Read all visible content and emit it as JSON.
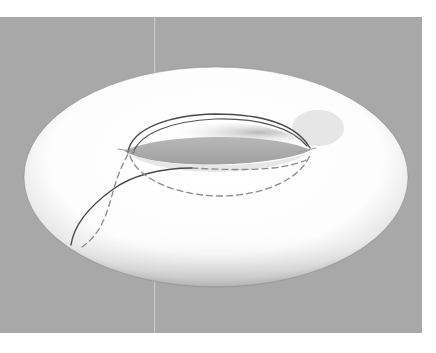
{
  "figure": {
    "colors": {
      "page_background": "#ffffff",
      "panel_background": "#a8a8a8",
      "torus_surface": "#ffffff",
      "torus_shadow": "#8f8f8f",
      "hole_interior": "#9c9c9c",
      "solid_curve": "#4a4a4a",
      "dashed_curve": "#8a8a8a"
    },
    "panel": {
      "x": 0,
      "y": 17,
      "width": 422,
      "height": 316
    },
    "torus": {
      "cx": 216,
      "cy": 177,
      "rx": 192,
      "ry": 110
    },
    "curves": [
      {
        "name": "upper-longitude-outer",
        "style": "solid"
      },
      {
        "name": "upper-longitude-inner",
        "style": "solid"
      },
      {
        "name": "meridian-front",
        "style": "solid"
      },
      {
        "name": "hidden-longitude",
        "style": "dashed"
      },
      {
        "name": "hidden-meridian",
        "style": "dashed"
      }
    ]
  }
}
